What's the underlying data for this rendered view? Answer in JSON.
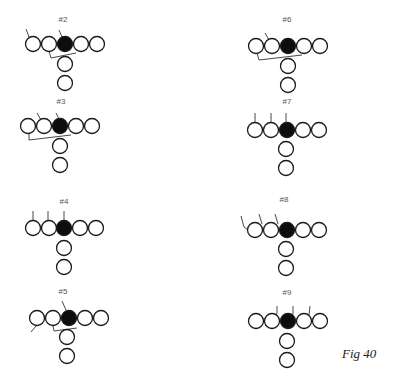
{
  "figure": {
    "caption": "Fig 40",
    "colors": {
      "stroke": "#1a1a1a",
      "filled": "#0d0d0d",
      "background": "#ffffff",
      "label": "#555555"
    },
    "circle_radius": 7.5
  },
  "diagrams": [
    {
      "label": "#2",
      "label_pos": [
        63,
        22
      ],
      "line": {
        "xs": [
          33,
          49,
          65,
          81,
          97
        ],
        "y": 44,
        "filled_index": 2
      },
      "backs": [
        [
          65,
          64
        ],
        [
          65,
          83
        ]
      ],
      "marks": [
        [
          [
            26,
            29
          ],
          [
            29,
            37
          ]
        ],
        [
          [
            59,
            30
          ],
          [
            62,
            37
          ]
        ],
        [
          [
            49,
            51
          ],
          [
            51,
            58
          ],
          [
            76,
            53
          ]
        ]
      ]
    },
    {
      "label": "#3",
      "label_pos": [
        61,
        104
      ],
      "line": {
        "xs": [
          28,
          44,
          60,
          76,
          92
        ],
        "y": 126,
        "filled_index": 2
      },
      "backs": [
        [
          60,
          146
        ],
        [
          60,
          165
        ]
      ],
      "marks": [
        [
          [
            37,
            113
          ],
          [
            41,
            120
          ]
        ],
        [
          [
            56,
            113
          ],
          [
            59,
            119
          ]
        ],
        [
          [
            29,
            133
          ],
          [
            29,
            140
          ],
          [
            71,
            135
          ]
        ]
      ]
    },
    {
      "label": "#4",
      "label_pos": [
        64,
        204
      ],
      "line": {
        "xs": [
          33,
          49,
          64,
          80,
          96
        ],
        "y": 228,
        "filled_index": 2
      },
      "backs": [
        [
          64,
          248
        ],
        [
          64,
          267
        ]
      ],
      "marks": [
        [
          [
            33,
            211
          ],
          [
            33,
            220
          ]
        ],
        [
          [
            48,
            211
          ],
          [
            48,
            220
          ]
        ],
        [
          [
            64,
            211
          ],
          [
            64,
            220
          ]
        ]
      ]
    },
    {
      "label": "#5",
      "label_pos": [
        63,
        294
      ],
      "line": {
        "xs": [
          37,
          53,
          69,
          85,
          101
        ],
        "y": 318,
        "filled_index": 2
      },
      "backs": [
        [
          67,
          337
        ],
        [
          67,
          356
        ]
      ],
      "marks": [
        [
          [
            62,
            301
          ],
          [
            66,
            310
          ]
        ],
        [
          [
            36,
            326
          ],
          [
            31,
            332
          ]
        ],
        [
          [
            53,
            326
          ],
          [
            54,
            331
          ],
          [
            77,
            328
          ]
        ]
      ]
    },
    {
      "label": "#6",
      "label_pos": [
        287,
        22
      ],
      "line": {
        "xs": [
          256,
          272,
          288,
          304,
          320
        ],
        "y": 46,
        "filled_index": 2
      },
      "backs": [
        [
          288,
          66
        ],
        [
          288,
          85
        ]
      ],
      "marks": [
        [
          [
            265,
            33
          ],
          [
            269,
            40
          ]
        ],
        [
          [
            257,
            53
          ],
          [
            259,
            60
          ],
          [
            302,
            55
          ]
        ]
      ]
    },
    {
      "label": "#7",
      "label_pos": [
        287,
        104
      ],
      "line": {
        "xs": [
          255,
          271,
          287,
          303,
          319
        ],
        "y": 130,
        "filled_index": 2
      },
      "backs": [
        [
          286,
          149
        ],
        [
          286,
          168
        ]
      ],
      "marks": [
        [
          [
            255,
            113
          ],
          [
            255,
            122
          ]
        ],
        [
          [
            271,
            113
          ],
          [
            271,
            122
          ]
        ],
        [
          [
            286,
            113
          ],
          [
            286,
            122
          ]
        ]
      ]
    },
    {
      "label": "#8",
      "label_pos": [
        284,
        202
      ],
      "line": {
        "xs": [
          255,
          271,
          287,
          303,
          319
        ],
        "y": 230,
        "filled_index": 2
      },
      "backs": [
        [
          286,
          249
        ],
        [
          286,
          268
        ]
      ],
      "marks": [
        [
          [
            241,
            216
          ],
          [
            244,
            227
          ],
          [
            248,
            230
          ]
        ],
        [
          [
            259,
            214
          ],
          [
            262,
            224
          ]
        ],
        [
          [
            275,
            214
          ],
          [
            278,
            224
          ]
        ]
      ]
    },
    {
      "label": "#9",
      "label_pos": [
        287,
        295
      ],
      "line": {
        "xs": [
          256,
          272,
          288,
          304,
          320
        ],
        "y": 321,
        "filled_index": 2
      },
      "backs": [
        [
          287,
          341
        ],
        [
          287,
          360
        ]
      ],
      "marks": [
        [
          [
            265,
            326
          ],
          [
            277,
            314
          ],
          [
            277,
            306
          ]
        ],
        [
          [
            282,
            324
          ],
          [
            293,
            314
          ],
          [
            293,
            306
          ]
        ],
        [
          [
            298,
            325
          ],
          [
            309,
            315
          ],
          [
            310,
            306
          ]
        ]
      ]
    }
  ]
}
